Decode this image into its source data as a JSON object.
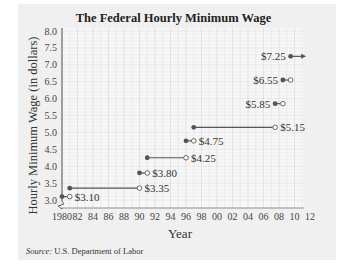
{
  "chart_data": {
    "type": "line",
    "subtype": "step",
    "title": "The Federal Hourly Minimum Wage",
    "xlabel": "Year",
    "ylabel": "Hourly Minimum Wage (in dollars)",
    "xlim": [
      1980,
      2012
    ],
    "ylim": [
      3.0,
      8.0
    ],
    "x_ticks": [
      "1980",
      "82",
      "84",
      "86",
      "88",
      "90",
      "92",
      "94",
      "96",
      "98",
      "00",
      "02",
      "04",
      "06",
      "08",
      "10",
      "12"
    ],
    "y_ticks": [
      "3.0",
      "3.5",
      "4.0",
      "4.5",
      "5.0",
      "5.5",
      "6.0",
      "6.5",
      "7.0",
      "7.5",
      "8.0"
    ],
    "grid": true,
    "segments": [
      {
        "start": 1980,
        "end": 1981,
        "value": 3.1,
        "label": "$3.10",
        "open_end": true
      },
      {
        "start": 1981,
        "end": 1990,
        "value": 3.35,
        "label": "$3.35",
        "open_end": true
      },
      {
        "start": 1990,
        "end": 1991,
        "value": 3.8,
        "label": "$3.80",
        "open_end": true
      },
      {
        "start": 1991,
        "end": 1996,
        "value": 4.25,
        "label": "$4.25",
        "open_end": true
      },
      {
        "start": 1996,
        "end": 1997,
        "value": 4.75,
        "label": "$4.75",
        "open_end": true
      },
      {
        "start": 1997,
        "end": 2007.5,
        "value": 5.15,
        "label": "$5.15",
        "open_end": true
      },
      {
        "start": 2007.5,
        "end": 2008.5,
        "value": 5.85,
        "label": "$5.85",
        "open_end": true
      },
      {
        "start": 2008.5,
        "end": 2009.5,
        "value": 6.55,
        "label": "$6.55",
        "open_end": true
      },
      {
        "start": 2009.5,
        "end": 2011.5,
        "value": 7.25,
        "label": "$7.25",
        "arrow": true
      }
    ],
    "axis_break": true,
    "source": "U.S. Department of Labor"
  },
  "labels": {
    "title": "The Federal Hourly Minimum Wage",
    "xlabel": "Year",
    "ylabel": "Hourly Minimum Wage (in dollars)",
    "source_prefix": "Source:",
    "source_text": " U.S. Department of Labor"
  },
  "colors": {
    "line": "#555555",
    "grid": "#d8d8d8",
    "text": "#333333",
    "panel": "#f0f0f0"
  }
}
